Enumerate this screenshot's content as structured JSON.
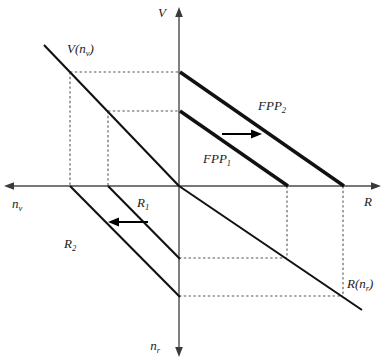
{
  "figure": {
    "type": "four-quadrant economic diagram"
  },
  "axes": {
    "vertical_up": {
      "label": "V",
      "name": "value-axis"
    },
    "vertical_down": {
      "label": "n",
      "sub": "r",
      "name": "labour-r-axis"
    },
    "horizontal_right": {
      "label": "R",
      "name": "resource-axis"
    },
    "horizontal_left": {
      "label": "n",
      "sub": "v",
      "name": "labour-v-axis"
    }
  },
  "curves": [
    {
      "id": "v-function",
      "label": "V(n",
      "sub": "v",
      "label_close": ")",
      "style": "thin",
      "quadrant": "upper-left"
    },
    {
      "id": "fpp1",
      "label": "FPP",
      "sub": "1",
      "style": "thick",
      "quadrant": "upper-right"
    },
    {
      "id": "fpp2",
      "label": "FPP",
      "sub": "2",
      "style": "thick",
      "quadrant": "upper-right"
    },
    {
      "id": "r1",
      "label": "R",
      "sub": "1",
      "style": "thin",
      "quadrant": "lower-left"
    },
    {
      "id": "r2",
      "label": "R",
      "sub": "2",
      "style": "thin",
      "quadrant": "lower-left"
    },
    {
      "id": "r-function",
      "label": "R(n",
      "sub": "r",
      "label_close": ")",
      "style": "thin",
      "quadrant": "lower-right"
    }
  ],
  "annotations": {
    "shift_right": {
      "name": "fpp-shift-arrow",
      "direction": "right"
    },
    "shift_left": {
      "name": "r-shift-arrow",
      "direction": "left"
    }
  },
  "colors": {
    "axis": "#4a4a4a",
    "curve": "#111111",
    "dotted": "#555555",
    "background": "#ffffff"
  }
}
